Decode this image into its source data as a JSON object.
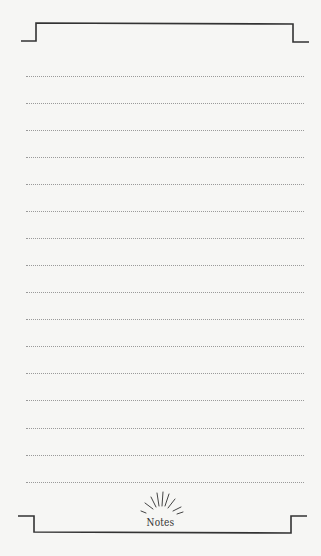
{
  "page": {
    "type": "notes-page",
    "title": "Notes",
    "line_count": 16,
    "colors": {
      "background": "#f6f6f4",
      "frame": "#333333",
      "rule": "#9a9a9a",
      "title": "#333333"
    }
  },
  "lines": [
    {
      "y": 76
    },
    {
      "y": 103
    },
    {
      "y": 130
    },
    {
      "y": 157
    },
    {
      "y": 184
    },
    {
      "y": 211
    },
    {
      "y": 238
    },
    {
      "y": 265
    },
    {
      "y": 292
    },
    {
      "y": 319
    },
    {
      "y": 346
    },
    {
      "y": 373
    },
    {
      "y": 400
    },
    {
      "y": 428
    },
    {
      "y": 455
    },
    {
      "y": 482
    }
  ]
}
